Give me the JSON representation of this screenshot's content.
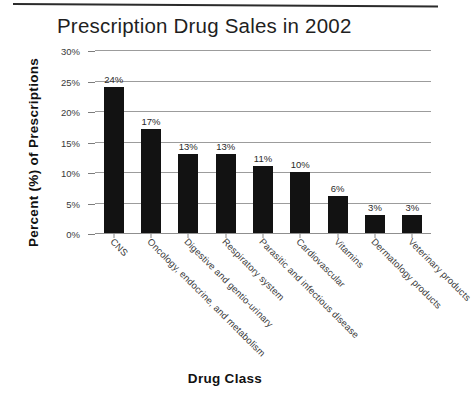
{
  "chart_data": {
    "type": "bar",
    "title": "Prescription Drug Sales in 2002",
    "xlabel": "Drug Class",
    "ylabel": "Percent (%) of Prescriptions",
    "categories": [
      "CNS",
      "Oncology, endocrine, and metabolism",
      "Digestive and gentio-urinary",
      "Respiratory system",
      "Parasitic and infectious disease",
      "Cardiovascular",
      "Vitamins",
      "Dermatology products",
      "Veterinary products"
    ],
    "values": [
      24,
      17,
      13,
      13,
      11,
      10,
      6,
      3,
      3
    ],
    "value_labels": [
      "24%",
      "17%",
      "13%",
      "13%",
      "11%",
      "10%",
      "6%",
      "3%",
      "3%"
    ],
    "ylim": [
      0,
      30
    ],
    "ytick_values": [
      0,
      5,
      10,
      15,
      20,
      25,
      30
    ],
    "ytick_labels": [
      "0%",
      "5%",
      "10%",
      "15%",
      "20%",
      "25%",
      "30%"
    ],
    "grid": true,
    "legend": false,
    "bar_color": "#121212",
    "gridline_color": "#9c9c9c",
    "background_color": "#ffffff"
  }
}
